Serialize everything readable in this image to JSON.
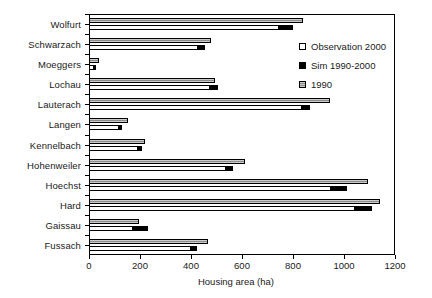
{
  "chart_data": {
    "type": "bar",
    "orientation": "horizontal",
    "title": "",
    "xlabel": "Housing area (ha)",
    "ylabel": "",
    "xlim": [
      0,
      1200
    ],
    "xticks": [
      0,
      200,
      400,
      600,
      800,
      1000,
      1200
    ],
    "grid": false,
    "legend_position": "upper right",
    "categories": [
      "Wolfurt",
      "Schwarzach",
      "Moeggers",
      "Lochau",
      "Lauterach",
      "Langen",
      "Kennelbach",
      "Hohenweiler",
      "Hoechst",
      "Hard",
      "Gaissau",
      "Fussach"
    ],
    "series": [
      {
        "name": "1990",
        "color": "#8c8c8c",
        "values": [
          840,
          478,
          38,
          494,
          945,
          152,
          220,
          612,
          1095,
          1140,
          196,
          466
        ]
      },
      {
        "name": "Observation 2000",
        "color": "#ffffff",
        "values": [
          800,
          455,
          28,
          505,
          865,
          128,
          208,
          565,
          1010,
          1110,
          230,
          425
        ]
      },
      {
        "name": "Sim 1990-2000",
        "color": "#000000",
        "description": "black segment at the right end of each Observation 2000 bar",
        "values": [
          800,
          455,
          28,
          505,
          865,
          128,
          208,
          565,
          1010,
          1110,
          230,
          425
        ],
        "segment_start": [
          740,
          425,
          14,
          470,
          830,
          112,
          190,
          535,
          945,
          1040,
          170,
          395
        ]
      }
    ]
  },
  "legend": {
    "items": [
      {
        "label": "Observation 2000",
        "swatch": "white-square"
      },
      {
        "label": "Sim 1990-2000",
        "swatch": "black-square"
      },
      {
        "label": "1990",
        "swatch": "gray-square"
      }
    ]
  },
  "axis": {
    "x_title": "Housing area (ha)",
    "x_tick_labels": [
      "0",
      "200",
      "400",
      "600",
      "800",
      "1000",
      "1200"
    ]
  }
}
